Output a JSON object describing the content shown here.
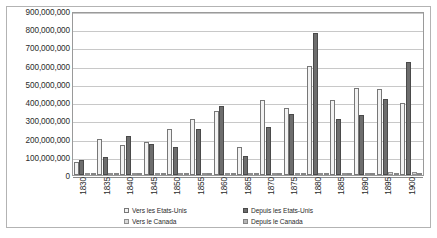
{
  "chart_data": {
    "type": "bar",
    "title": "",
    "subtitle": "",
    "xlabel": "",
    "ylabel": "",
    "ylim": [
      0,
      900000000
    ],
    "ytick_step": 100000000,
    "grid": true,
    "legend_position": "bottom",
    "ytick_labels": [
      "900,000,000",
      "800,000,000",
      "700,000,000",
      "600,000,000",
      "500,000,000",
      "400,000,000",
      "300,000,000",
      "200,000,000",
      "100,000,000",
      "0"
    ],
    "ytick_values": [
      900000000,
      800000000,
      700000000,
      600000000,
      500000000,
      400000000,
      300000000,
      200000000,
      100000000,
      0
    ],
    "categories": [
      "1830",
      "1835",
      "1840",
      "1845",
      "1850",
      "1855",
      "1860",
      "1865",
      "1870",
      "1875",
      "1880",
      "1885",
      "1890",
      "1895",
      "1900"
    ],
    "series": [
      {
        "name": "Vers les Etats-Unis",
        "color": "#f2f2f2",
        "values": [
          70000000,
          195000000,
          165000000,
          180000000,
          250000000,
          310000000,
          350000000,
          155000000,
          410000000,
          370000000,
          600000000,
          410000000,
          480000000,
          470000000,
          395000000
        ]
      },
      {
        "name": "Depuis les Etats-Unis",
        "color": "#6d6d6d",
        "values": [
          85000000,
          100000000,
          215000000,
          170000000,
          155000000,
          255000000,
          380000000,
          105000000,
          265000000,
          335000000,
          780000000,
          305000000,
          330000000,
          415000000,
          620000000
        ]
      },
      {
        "name": "Vers le Canada",
        "color": "#d9d9d9",
        "values": [
          2000000,
          2000000,
          3000000,
          3000000,
          4000000,
          5000000,
          6000000,
          4000000,
          8000000,
          9000000,
          12000000,
          10000000,
          13000000,
          14000000,
          16000000
        ]
      },
      {
        "name": "Depuis le Canada",
        "color": "#b5b5b5",
        "values": [
          1500000,
          1500000,
          2000000,
          2500000,
          3000000,
          4000000,
          5000000,
          3000000,
          6000000,
          7000000,
          9000000,
          8000000,
          10000000,
          11000000,
          12000000
        ]
      }
    ]
  },
  "legend": {
    "items": [
      {
        "label": "Vers les Etats-Unis",
        "swatch": "s-vers-us"
      },
      {
        "label": "Depuis les Etats-Unis",
        "swatch": "s-depuis-us"
      },
      {
        "label": "Vers le Canada",
        "swatch": "s-vers-ca"
      },
      {
        "label": "Depuis le Canada",
        "swatch": "s-depuis-ca"
      }
    ]
  }
}
